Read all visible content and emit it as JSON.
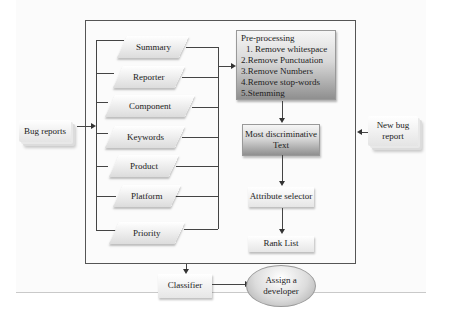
{
  "diagram": {
    "inputs": {
      "bug_reports": "Bug reports",
      "new_bug_report": "New bug report"
    },
    "fields": [
      {
        "label": "Summary"
      },
      {
        "label": "Reporter"
      },
      {
        "label": "Component"
      },
      {
        "label": "Keywords"
      },
      {
        "label": "Product"
      },
      {
        "label": "Platform"
      },
      {
        "label": "Priority"
      }
    ],
    "preprocessing": {
      "title": "Pre-processing",
      "steps": [
        "1. Remove whitespace",
        "2.Remove Punctuation",
        "3.Remove Numbers",
        "4.Remove stop-words",
        "5.Stemming"
      ]
    },
    "most_discriminative": "Most discriminative Text",
    "attribute_selector": "Attribute selector",
    "rank_list": "Rank List",
    "classifier": "Classifier",
    "assign_developer": "Assign a developer"
  }
}
